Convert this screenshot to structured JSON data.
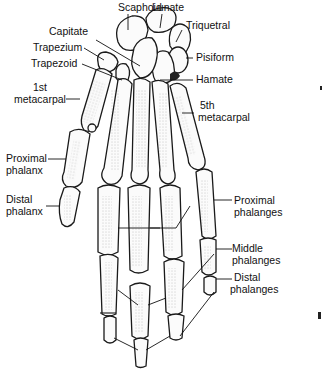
{
  "diagram": {
    "carpals": {
      "scaphoid": "Scaphoid",
      "lunate": "Lunate",
      "triquetral": "Triquetral",
      "pisiform": "Pisiform",
      "hamate": "Hamate",
      "capitate": "Capitate",
      "trapezium": "Trapezium",
      "trapezoid": "Trapezoid"
    },
    "metacarpals": {
      "first_line1": "1st",
      "first_line2": "metacarpal",
      "fifth_line1": "5th",
      "fifth_line2": "metacarpal"
    },
    "thumb": {
      "proximal_line1": "Proximal",
      "proximal_line2": "phalanx",
      "distal_line1": "Distal",
      "distal_line2": "phalanx"
    },
    "fingers": {
      "proximal_line1": "Proximal",
      "proximal_line2": "phalanges",
      "middle_line1": "Middle",
      "middle_line2": "phalanges",
      "distal_line1": "Distal",
      "distal_line2": "phalanges"
    }
  }
}
